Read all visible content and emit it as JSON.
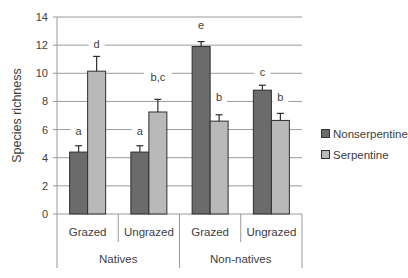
{
  "chart_data": {
    "type": "bar",
    "title": "",
    "xlabel": "",
    "ylabel": "Species richness",
    "ylim": [
      0,
      14
    ],
    "yticks": [
      0,
      2,
      4,
      6,
      8,
      10,
      12,
      14
    ],
    "grid": true,
    "legend_position": "right",
    "groups": [
      {
        "label": "Natives",
        "categories": [
          "Grazed",
          "Ungrazed"
        ]
      },
      {
        "label": "Non-natives",
        "categories": [
          "Grazed",
          "Ungrazed"
        ]
      }
    ],
    "categories": [
      "Natives / Grazed",
      "Natives / Ungrazed",
      "Non-natives / Grazed",
      "Non-natives / Ungrazed"
    ],
    "series": [
      {
        "name": "Nonserpentine",
        "color": "#6b6b6b",
        "values": [
          4.4,
          4.4,
          11.9,
          8.8
        ],
        "errors": [
          0.45,
          0.45,
          0.35,
          0.35
        ],
        "labels": [
          "a",
          "a",
          "e",
          "c"
        ]
      },
      {
        "name": "Serpentine",
        "color": "#b9b9b9",
        "values": [
          10.15,
          7.25,
          6.6,
          6.65
        ],
        "errors": [
          1.05,
          0.9,
          0.45,
          0.5
        ],
        "labels": [
          "d",
          "b,c",
          "b",
          "b"
        ]
      }
    ]
  },
  "legend": {
    "items": [
      {
        "label": "Nonserpentine",
        "color": "#6b6b6b"
      },
      {
        "label": "Serpentine",
        "color": "#b9b9b9"
      }
    ]
  }
}
